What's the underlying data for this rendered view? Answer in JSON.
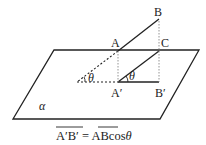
{
  "diagram": {
    "plane_label": "α",
    "points": {
      "A": "A",
      "B": "B",
      "C": "C",
      "A_prime": "A′",
      "B_prime": "B′"
    },
    "angle_labels": {
      "outer_theta": "θ",
      "inner_theta": "θ"
    },
    "formula": {
      "lhs": "A′B′",
      "equals": " = ",
      "rhs_segment": "AB",
      "rhs_rest": "cos",
      "theta": "θ"
    },
    "colors": {
      "line": "#222222",
      "dotted": "#888888",
      "background": "#ffffff"
    }
  }
}
